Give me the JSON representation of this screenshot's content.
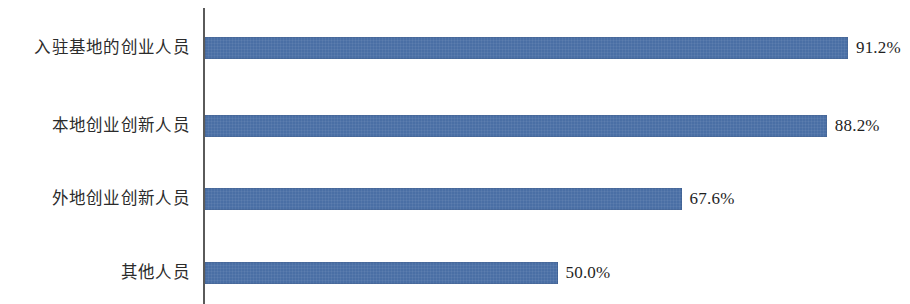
{
  "chart_data": {
    "type": "bar",
    "orientation": "horizontal",
    "title": "",
    "subtitle": "",
    "xlabel": "",
    "ylabel": "",
    "xlim": [
      0,
      100
    ],
    "grid": false,
    "legend": null,
    "value_suffix": "%",
    "categories": [
      "入驻基地的创业人员",
      "本地创业创新人员",
      "外地创业创新人员",
      "其他人员"
    ],
    "values": [
      91.2,
      88.2,
      67.6,
      50.0
    ],
    "value_labels": [
      "91.2%",
      "88.2%",
      "67.6%",
      "50.0%"
    ],
    "series": [
      {
        "name": "",
        "values": [
          91.2,
          88.2,
          67.6,
          50.0
        ]
      }
    ],
    "colors": {
      "bar": "#4a6fa5",
      "axis": "#5a5a5a",
      "label_text": "#2b2b2b",
      "value_text": "#1f1f1f",
      "background": "#ffffff"
    }
  },
  "rows": [
    {
      "label": "入驻基地的创业人员",
      "value_label": "91.2%",
      "value": 91.2
    },
    {
      "label": "本地创业创新人员",
      "value_label": "88.2%",
      "value": 88.2
    },
    {
      "label": "外地创业创新人员",
      "value_label": "67.6%",
      "value": 67.6
    },
    {
      "label": "其他人员",
      "value_label": "50.0%",
      "value": 50.0
    }
  ]
}
